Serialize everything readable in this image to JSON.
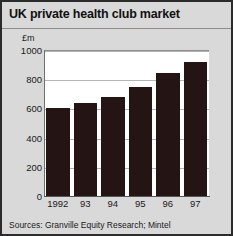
{
  "chart_data": {
    "type": "bar",
    "title": "UK private health club market",
    "unit_label": "£m",
    "xlabel": "",
    "ylabel": "£m",
    "categories": [
      "1992",
      "93",
      "94",
      "95",
      "96",
      "97"
    ],
    "values": [
      600,
      635,
      675,
      750,
      840,
      920
    ],
    "ylim": [
      0,
      1000
    ],
    "yticks": [
      1000,
      800,
      600,
      400,
      200,
      0
    ],
    "ytick_labels": [
      "1000",
      "800",
      "600",
      "400",
      "200",
      "0"
    ],
    "grid": true,
    "legend": "none",
    "bar_color": "#241414",
    "plot_background": "#ffffff",
    "figure_background": "#d9d9d9",
    "source": "Sources: Granville Equity Research; Mintel"
  }
}
